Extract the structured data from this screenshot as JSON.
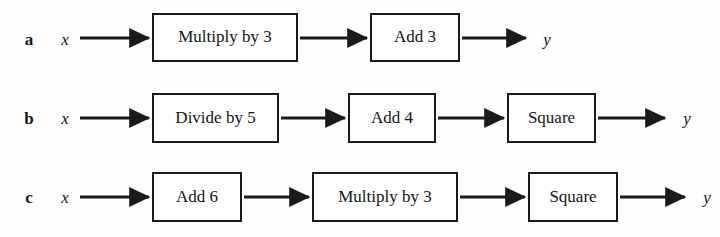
{
  "figure": {
    "type": "function-machine-flow-diagram",
    "background_color": "#fefefe",
    "line_color": "#1a1a1a",
    "input_variable": "x",
    "output_variable": "y",
    "rows": [
      {
        "label": "a",
        "input": "x",
        "output": "y",
        "boxes": [
          {
            "text": "Multiply by 3",
            "x": 152,
            "width": 146
          },
          {
            "text": "Add 3",
            "x": 370,
            "width": 90
          }
        ],
        "box_top": 13,
        "box_height": 49,
        "arrows": [
          {
            "x1": 80,
            "x2": 150
          },
          {
            "x1": 300,
            "x2": 368
          },
          {
            "x1": 462,
            "x2": 527
          }
        ],
        "output_x": 536
      },
      {
        "label": "b",
        "input": "x",
        "output": "y",
        "boxes": [
          {
            "text": "Divide by 5",
            "x": 152,
            "width": 127
          },
          {
            "text": "Add 4",
            "x": 348,
            "width": 88
          },
          {
            "text": "Square",
            "x": 507,
            "width": 89
          }
        ],
        "box_top": 14,
        "box_height": 50,
        "arrows": [
          {
            "x1": 80,
            "x2": 150
          },
          {
            "x1": 281,
            "x2": 346
          },
          {
            "x1": 438,
            "x2": 505
          },
          {
            "x1": 598,
            "x2": 666
          }
        ],
        "output_x": 676
      },
      {
        "label": "c",
        "input": "x",
        "output": "y",
        "boxes": [
          {
            "text": "Add 6",
            "x": 152,
            "width": 90
          },
          {
            "text": "Multiply by 3",
            "x": 312,
            "width": 146
          },
          {
            "text": "Square",
            "x": 528,
            "width": 90
          }
        ],
        "box_top": 14,
        "box_height": 50,
        "arrows": [
          {
            "x1": 80,
            "x2": 150
          },
          {
            "x1": 244,
            "x2": 310
          },
          {
            "x1": 460,
            "x2": 526
          },
          {
            "x1": 620,
            "x2": 686
          }
        ],
        "output_x": 696
      }
    ]
  }
}
